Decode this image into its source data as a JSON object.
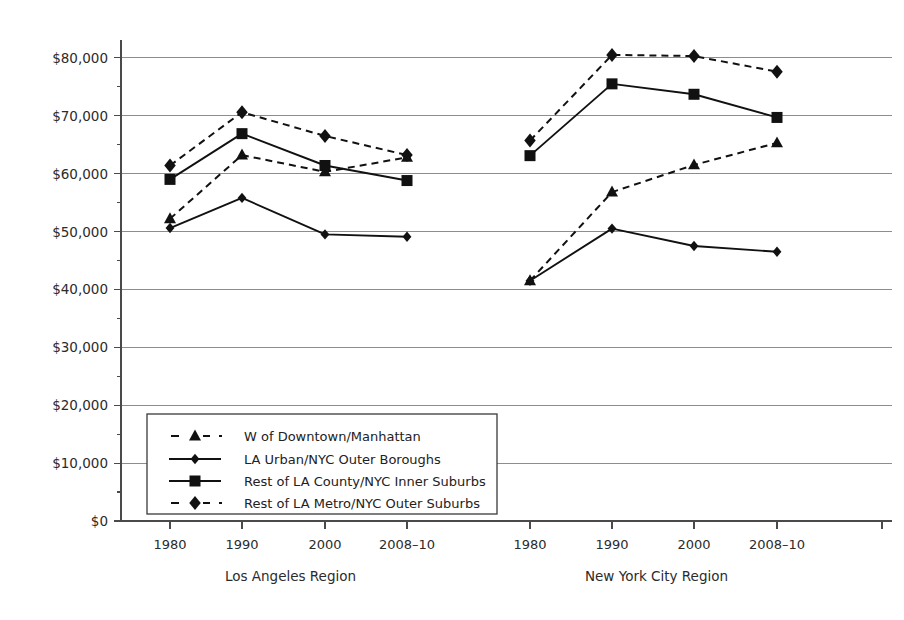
{
  "chart_data": {
    "type": "line",
    "title": "",
    "xlabel": "",
    "ylabel": "",
    "ylim": [
      0,
      85000
    ],
    "grid": true,
    "legend_position": "inside-lower-left",
    "y_ticks": [
      "$0",
      "$10,000",
      "$20,000",
      "$30,000",
      "$40,000",
      "$50,000",
      "$60,000",
      "$70,000",
      "$80,000"
    ],
    "y_tick_values": [
      0,
      10000,
      20000,
      30000,
      40000,
      50000,
      60000,
      70000,
      80000
    ],
    "x_tick_labels": [
      "1980",
      "1990",
      "2000",
      "2008–10",
      "1980",
      "1990",
      "2000",
      "2008–10"
    ],
    "groups": [
      {
        "name": "Los Angeles Region",
        "categories": [
          "1980",
          "1990",
          "2000",
          "2008–10"
        ]
      },
      {
        "name": "New York City Region",
        "categories": [
          "1980",
          "1990",
          "2000",
          "2008–10"
        ]
      }
    ],
    "series": [
      {
        "name": "W of Downtown/Manhattan",
        "marker": "triangle",
        "style": "dashed",
        "la_values": [
          52200,
          63200,
          60300,
          62800
        ],
        "nyc_values": [
          41500,
          56800,
          61500,
          65300
        ]
      },
      {
        "name": "LA Urban/NYC Outer Boroughs",
        "marker": "diamond-small",
        "style": "solid",
        "la_values": [
          50600,
          55800,
          49500,
          49100
        ],
        "nyc_values": [
          41500,
          50500,
          47500,
          46500
        ]
      },
      {
        "name": "Rest of LA County/NYC Inner Suburbs",
        "marker": "square",
        "style": "solid",
        "la_values": [
          59000,
          66900,
          61400,
          58800
        ],
        "nyc_values": [
          63100,
          75500,
          73700,
          69700
        ]
      },
      {
        "name": "Rest of LA Metro/NYC Outer Suburbs",
        "marker": "diamond",
        "style": "dashed",
        "la_values": [
          61400,
          70600,
          66500,
          63200
        ],
        "nyc_values": [
          65700,
          80500,
          80300,
          77600
        ]
      }
    ]
  },
  "legend": {
    "entries": [
      {
        "label": "W of Downtown/Manhattan",
        "marker": "triangle",
        "style": "dashed"
      },
      {
        "label": "LA Urban/NYC Outer Boroughs",
        "marker": "diamond-small",
        "style": "solid"
      },
      {
        "label": "Rest of LA County/NYC Inner Suburbs",
        "marker": "square",
        "style": "solid"
      },
      {
        "label": "Rest of LA Metro/NYC Outer Suburbs",
        "marker": "diamond",
        "style": "dashed"
      }
    ]
  },
  "colors": {
    "ink": "#111111",
    "grid": "#8d8d8d",
    "axis": "#4a4a4a",
    "background": "#ffffff"
  }
}
